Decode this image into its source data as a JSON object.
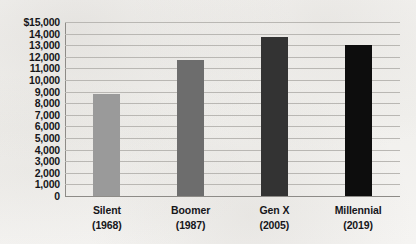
{
  "chart_data": {
    "type": "bar",
    "title": "",
    "subtitle": "",
    "xlabel": "",
    "ylabel": "",
    "ylim": [
      0,
      15000
    ],
    "grid": true,
    "legend": false,
    "categories": [
      "Silent",
      "Boomer",
      "Gen X",
      "Millennial"
    ],
    "category_years": [
      "(1968)",
      "(1987)",
      "(2005)",
      "(2019)"
    ],
    "values": [
      8800,
      11700,
      13700,
      13000
    ],
    "bar_colors": [
      "#9a9a9a",
      "#6d6d6d",
      "#333333",
      "#0d0d0d"
    ],
    "y_ticks": [
      {
        "value": 15000,
        "label": "$15,000"
      },
      {
        "value": 14000,
        "label": "14,000"
      },
      {
        "value": 13000,
        "label": "13,000"
      },
      {
        "value": 12000,
        "label": "12,000"
      },
      {
        "value": 11000,
        "label": "11,000"
      },
      {
        "value": 10000,
        "label": "10,000"
      },
      {
        "value": 9000,
        "label": "9,000"
      },
      {
        "value": 8000,
        "label": "8,000"
      },
      {
        "value": 7000,
        "label": "7,000"
      },
      {
        "value": 6000,
        "label": "6,000"
      },
      {
        "value": 5000,
        "label": "5,000"
      },
      {
        "value": 4000,
        "label": "4,000"
      },
      {
        "value": 3000,
        "label": "3,000"
      },
      {
        "value": 2000,
        "label": "2,000"
      },
      {
        "value": 1000,
        "label": "1,000"
      },
      {
        "value": 0,
        "label": "0"
      }
    ]
  }
}
